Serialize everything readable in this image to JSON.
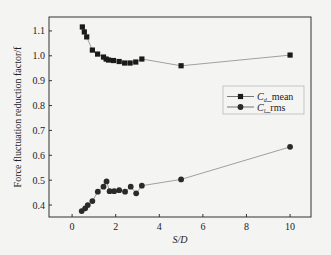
{
  "chart_data": {
    "type": "line",
    "title": "",
    "xlabel": "S/D",
    "ylabel": "Force fluctuation reduction factor/f",
    "xlim": [
      -1.06,
      10.96
    ],
    "ylim": [
      0.352,
      1.156
    ],
    "xticks": [
      0,
      2,
      4,
      6,
      8,
      10
    ],
    "yticks": [
      0.4,
      0.5,
      0.6,
      0.7,
      0.8,
      0.9,
      1.0,
      1.1
    ],
    "ytick_labels": [
      "0.4",
      "0.5",
      "0.6",
      "0.7",
      "0.8",
      "0.9",
      "1.0",
      "1.1"
    ],
    "xtick_labels": [
      "0",
      "2",
      "4",
      "6",
      "8",
      "10"
    ],
    "grid": false,
    "legend_position": "right-middle, inside plot",
    "series": [
      {
        "name": "C_d_mean",
        "label_main": "C",
        "label_sub": "d",
        "label_suffix": "mean",
        "marker": "square",
        "color": "#1a1a1a",
        "line_color": "#8a8a8a",
        "x": [
          0.47,
          0.56,
          0.67,
          0.93,
          1.17,
          1.44,
          1.56,
          1.67,
          1.9,
          2.16,
          2.41,
          2.66,
          2.92,
          3.2,
          5.0,
          10.0
        ],
        "y": [
          1.116,
          1.096,
          1.076,
          1.023,
          1.007,
          0.995,
          0.987,
          0.983,
          0.981,
          0.977,
          0.971,
          0.971,
          0.975,
          0.987,
          0.96,
          1.003
        ]
      },
      {
        "name": "C_l_rms",
        "label_main": "C",
        "label_sub": "l",
        "label_suffix": "rms",
        "marker": "circle",
        "color": "#2a2a2a",
        "line_color": "#8a8a8a",
        "x": [
          0.44,
          0.6,
          0.72,
          0.93,
          1.18,
          1.44,
          1.58,
          1.72,
          1.93,
          2.16,
          2.43,
          2.69,
          2.94,
          3.2,
          5.0,
          10.0
        ],
        "y": [
          0.376,
          0.387,
          0.4,
          0.416,
          0.454,
          0.474,
          0.495,
          0.456,
          0.456,
          0.46,
          0.454,
          0.474,
          0.447,
          0.478,
          0.503,
          0.634
        ]
      }
    ]
  },
  "layout": {
    "plot_left": 49,
    "plot_right": 311,
    "plot_top": 17,
    "plot_bottom": 217,
    "axis_color": "#333333",
    "background": "#f4f4f2"
  }
}
